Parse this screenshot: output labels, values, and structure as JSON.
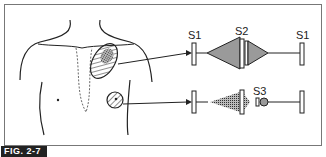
{
  "figure": {
    "label": "FIG. 2-7"
  },
  "top_trace": {
    "labels": [
      "S1",
      "S2",
      "S1"
    ],
    "description": "Systolic diamond-shaped murmur between S1 and S2, heard at upper left chest region"
  },
  "bottom_trace": {
    "labels": [
      "S3"
    ],
    "description": "Decrescendo diastolic murmur after S2 followed by S3, heard at apex region"
  },
  "colors": {
    "line": "#222222",
    "shade": "#8a8a8a",
    "border": "#777777"
  }
}
